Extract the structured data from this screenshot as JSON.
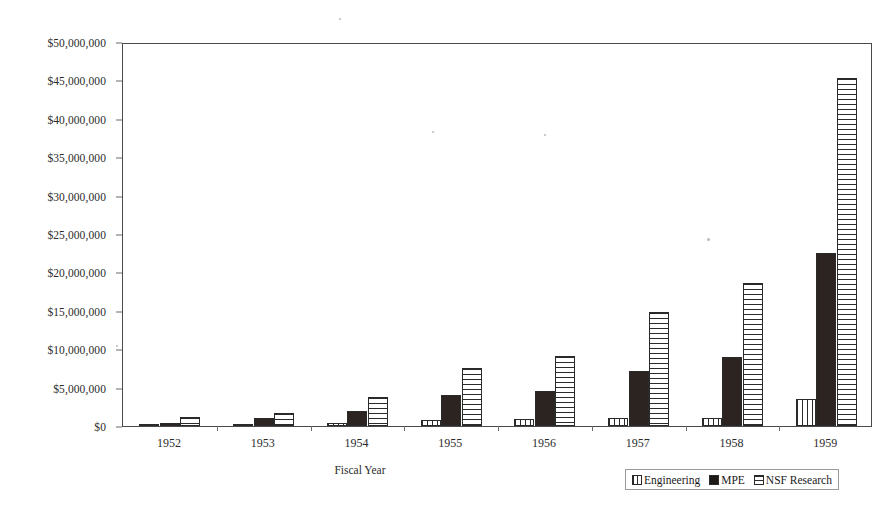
{
  "chart_data": {
    "type": "bar",
    "title": "",
    "subtitle": "",
    "xlabel": "Fiscal Year",
    "ylabel": "",
    "categories": [
      "1952",
      "1953",
      "1954",
      "1955",
      "1956",
      "1957",
      "1958",
      "1959"
    ],
    "series": [
      {
        "name": "Engineering",
        "values": [
          100000,
          150000,
          400000,
          800000,
          900000,
          1000000,
          1100000,
          3500000
        ]
      },
      {
        "name": "MPE",
        "values": [
          400000,
          1000000,
          1900000,
          4100000,
          4500000,
          7100000,
          9000000,
          22500000
        ]
      },
      {
        "name": "NSF Research",
        "values": [
          1200000,
          1700000,
          3800000,
          7500000,
          9100000,
          14900000,
          18600000,
          45300000
        ]
      }
    ],
    "ylim": [
      0,
      50000000
    ],
    "ytick_values": [
      0,
      5000000,
      10000000,
      15000000,
      20000000,
      25000000,
      30000000,
      35000000,
      40000000,
      45000000,
      50000000
    ],
    "ytick_labels": [
      "$0",
      "$5,000,000",
      "$10,000,000",
      "$15,000,000",
      "$20,000,000",
      "$25,000,000",
      "$30,000,000",
      "$35,000,000",
      "$40,000,000",
      "$45,000,000",
      "$50,000,000"
    ],
    "grid": false,
    "legend_position": "bottom-right",
    "legend_entries": [
      {
        "label": "Engineering",
        "pattern": "vertical-stripes"
      },
      {
        "label": "MPE",
        "pattern": "solid-black"
      },
      {
        "label": "NSF Research",
        "pattern": "horizontal-stripes"
      }
    ],
    "colors": {
      "solid": "#2b2420",
      "outline": "#2a2a2a",
      "axis": "#4a4a4a",
      "background": "#ffffff",
      "text": "#1a1a1a"
    }
  }
}
